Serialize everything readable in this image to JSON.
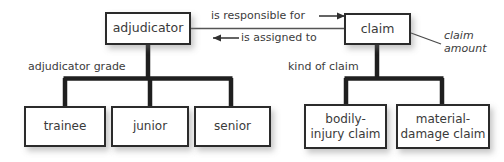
{
  "diagram": {
    "background_color": "#ffffff",
    "box_fill": "#ffffff",
    "box_border_color": "#2b2b2b",
    "connector_color": "#1f1f1f",
    "text_color": "#3a3a3a"
  },
  "nodes": {
    "adjudicator": {
      "label": "adjudicator"
    },
    "claim": {
      "label": "claim"
    },
    "trainee": {
      "label": "trainee"
    },
    "junior": {
      "label": "junior"
    },
    "senior": {
      "label": "senior"
    },
    "bodily_injury_claim": {
      "label": "bodily-\ninjury claim"
    },
    "material_damage_claim": {
      "label": "material-\ndamage claim"
    }
  },
  "edge_labels": {
    "adjudicator_grade": "adjudicator grade",
    "kind_of_claim": "kind of claim",
    "is_responsible_for": "is responsible for",
    "is_assigned_to": "is assigned to"
  },
  "annotations": {
    "claim_amount": "claim\namount"
  },
  "arrows": {
    "right_arrow_icon": "arrow-right-icon",
    "left_arrow_icon": "arrow-left-icon"
  },
  "generalizations": {
    "adjudicator_children": [
      "trainee",
      "junior",
      "senior"
    ],
    "claim_children": [
      "bodily_injury_claim",
      "material_damage_claim"
    ]
  }
}
